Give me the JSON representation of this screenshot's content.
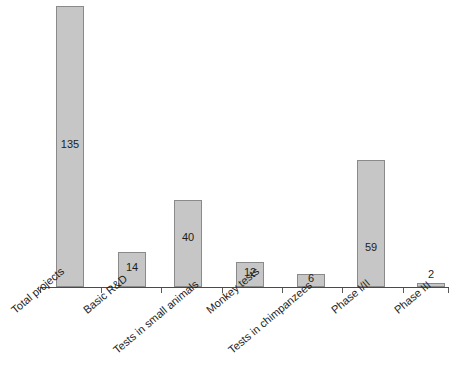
{
  "chart_data": {
    "type": "bar",
    "title": "",
    "subtitle": "",
    "xlabel": "",
    "ylabel": "",
    "categories": [
      "Total projects",
      "Basic R&D",
      "Tests in small animals",
      "Monkey tests",
      "Tests in chimpanzees",
      "Phase I/II",
      "Phase III"
    ],
    "values": [
      135,
      14,
      40,
      12,
      6,
      59,
      2
    ],
    "value_labels": [
      "135",
      "14",
      "40",
      "12",
      "6",
      "59",
      "2"
    ],
    "ylim": [
      0,
      140
    ],
    "grid": false,
    "legend": false,
    "legend_position": "none",
    "axis_ticks_visible": true,
    "y_axis_visible": false,
    "value_label_placement": [
      "inside",
      "inside",
      "inside",
      "inside",
      "inside",
      "inside",
      "above"
    ],
    "series": [
      {
        "name": "Projects",
        "values": [
          135,
          14,
          40,
          12,
          6,
          59,
          2
        ]
      }
    ]
  },
  "colors": {
    "bar_fill": "#c6c6c6",
    "bar_stroke": "#8a8a8a",
    "axis": "#4a4a4a",
    "text": "#1d1d1d",
    "background": "#ffffff"
  },
  "geometry": {
    "bars": [
      {
        "left": 56,
        "top": 6,
        "width": 28,
        "height": 281,
        "label_top": 138,
        "label_left": 56
      },
      {
        "left": 118,
        "top": 252,
        "width": 28,
        "height": 35,
        "label_top": 261,
        "label_left": 118
      },
      {
        "left": 174,
        "top": 200,
        "width": 28,
        "height": 87,
        "label_top": 231,
        "label_left": 174
      },
      {
        "left": 236,
        "top": 262,
        "width": 28,
        "height": 25,
        "label_top": 266,
        "label_left": 236
      },
      {
        "left": 297,
        "top": 274,
        "width": 28,
        "height": 13,
        "label_top": 272,
        "label_left": 297
      },
      {
        "left": 357,
        "top": 160,
        "width": 28,
        "height": 127,
        "label_top": 241,
        "label_left": 357
      },
      {
        "left": 417,
        "top": 283,
        "width": 28,
        "height": 4,
        "label_top": 268,
        "label_left": 417
      }
    ],
    "ticks": [
      40,
      101,
      161,
      222,
      282,
      342,
      403,
      448
    ],
    "labels": [
      {
        "left": 13,
        "top": 18
      },
      {
        "left": 85,
        "top": 18
      },
      {
        "left": 115,
        "top": 58
      },
      {
        "left": 208,
        "top": 18
      },
      {
        "left": 230,
        "top": 58
      },
      {
        "left": 333,
        "top": 18
      },
      {
        "left": 396,
        "top": 18
      }
    ]
  }
}
